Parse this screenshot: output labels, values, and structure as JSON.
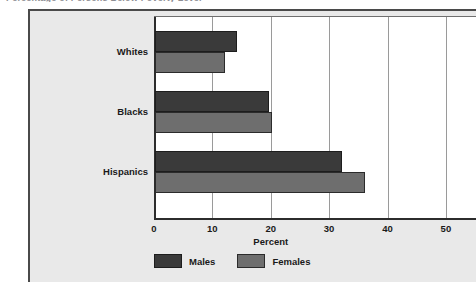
{
  "clipped_title": "Percentage of Persons Below Poverty Level",
  "chart_data": {
    "type": "bar",
    "orientation": "horizontal",
    "title": "",
    "xlabel": "Percent",
    "ylabel": "",
    "categories": [
      "Whites",
      "Blacks",
      "Hispanics"
    ],
    "series": [
      {
        "name": "Males",
        "color": "#3a3a3a",
        "values": [
          14,
          19.5,
          32
        ]
      },
      {
        "name": "Females",
        "color": "#6e6e6e",
        "values": [
          12,
          20,
          36
        ]
      }
    ],
    "xlim": [
      0,
      55.5
    ],
    "xticks": [
      0,
      10,
      20,
      30,
      40,
      50
    ],
    "xtick_labels": [
      "0",
      "10",
      "20",
      "30",
      "40",
      "50"
    ],
    "gridlines": [
      10,
      20,
      30,
      40,
      50
    ],
    "grid": true,
    "legend_position": "bottom"
  },
  "colors": {
    "panel_background": "#e9e9e9",
    "plot_background": "#ffffff",
    "frame": "#4a4a4a",
    "axis": "#2c2c2c",
    "gridline": "#9a9a9a",
    "males": "#3a3a3a",
    "females": "#6e6e6e"
  }
}
